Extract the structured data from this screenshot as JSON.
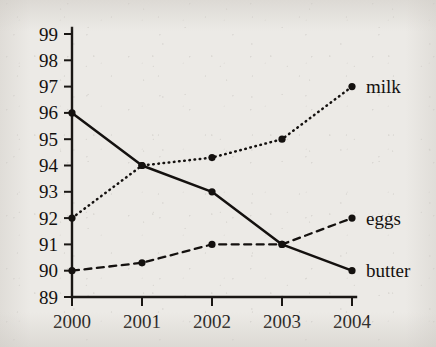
{
  "chart_data": {
    "type": "line",
    "title": "",
    "subtitle": "",
    "xlabel": "",
    "ylabel": "",
    "categories": [
      "2000",
      "2001",
      "2002",
      "2003",
      "2004"
    ],
    "x": [
      2000,
      2001,
      2002,
      2003,
      2004
    ],
    "xlim": [
      2000,
      2004
    ],
    "ylim": [
      89,
      99
    ],
    "y_ticks": [
      89,
      90,
      91,
      92,
      93,
      94,
      95,
      96,
      97,
      98,
      99
    ],
    "x_ticks": [
      "2000",
      "2001",
      "2002",
      "2003",
      "2004"
    ],
    "grid": false,
    "legend_position": "inline-right",
    "series": [
      {
        "name": "milk",
        "label": "milk",
        "line_style": "dotted",
        "color": "#14110f",
        "marker": "circle",
        "values": [
          92,
          94,
          94.3,
          95,
          97
        ]
      },
      {
        "name": "butter",
        "label": "butter",
        "line_style": "solid",
        "color": "#14110f",
        "marker": "circle",
        "values": [
          96,
          94,
          93,
          91,
          90
        ]
      },
      {
        "name": "eggs",
        "label": "eggs",
        "line_style": "dashed",
        "color": "#14110f",
        "marker": "circle",
        "values": [
          90,
          90.3,
          91,
          91,
          92
        ]
      }
    ]
  },
  "axes": {
    "y_tick_labels": [
      "99",
      "98",
      "97",
      "96",
      "95",
      "94",
      "93",
      "92",
      "91",
      "90",
      "89"
    ],
    "x_tick_labels": [
      "2000",
      "2001",
      "2002",
      "2003",
      "2004"
    ]
  },
  "labels": {
    "milk": "milk",
    "eggs": "eggs",
    "butter": "butter"
  },
  "colors": {
    "ink": "#14110f",
    "paper": "#eceae6"
  }
}
